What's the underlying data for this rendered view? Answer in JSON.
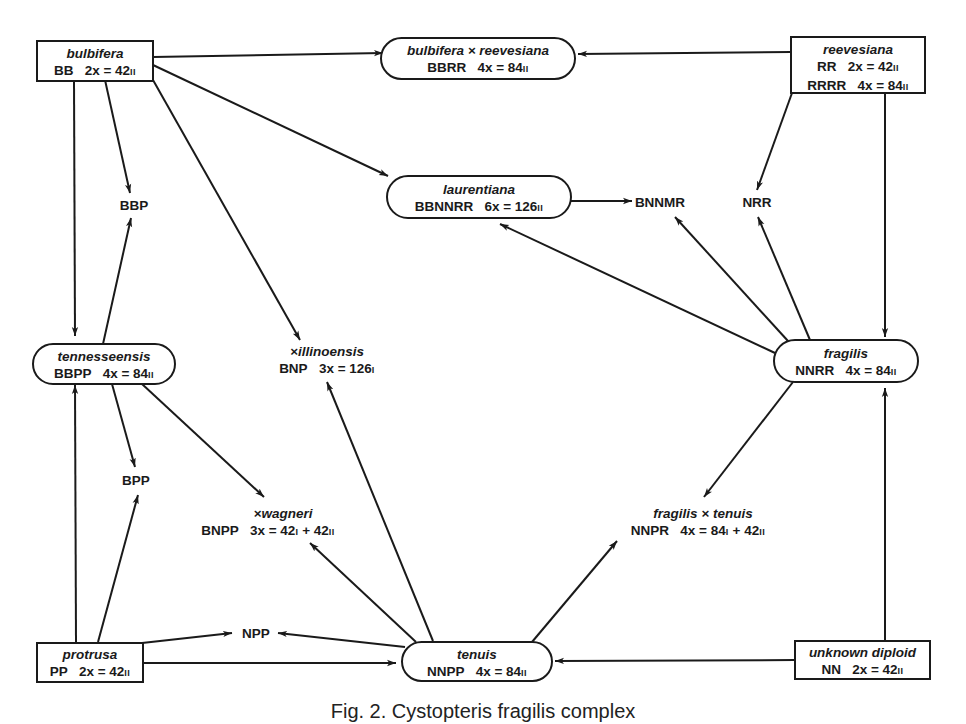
{
  "nodes": {
    "bulbifera": {
      "name": "bulbifera",
      "genome": "BB",
      "formula": "2x = 42",
      "pairing": "II"
    },
    "bulb_x_reev": {
      "name": "bulbifera × reevesiana",
      "genome": "BBRR",
      "formula": "4x = 84",
      "pairing": "II"
    },
    "reevesiana": {
      "name": "reevesiana",
      "genome": "RR",
      "formula": "2x = 42",
      "pairing": "II",
      "genome2": "RRRR",
      "formula2": "4x = 84",
      "pairing2": "II"
    },
    "bbp": {
      "genome": "BBP"
    },
    "laurentiana": {
      "name": "laurentiana",
      "genome": "BBNNRR",
      "formula": "6x = 126",
      "pairing": "II"
    },
    "bnnmr": {
      "genome": "BNNMR"
    },
    "nrr": {
      "genome": "NRR"
    },
    "tennesseensis": {
      "name": "tennesseensis",
      "genome": "BBPP",
      "formula": "4x = 84",
      "pairing": "II"
    },
    "illinoensis": {
      "name": "×illinoensis",
      "genome": "BNP",
      "formula": "3x = 126",
      "pairing": "I"
    },
    "fragilis": {
      "name": "fragilis",
      "genome": "NNRR",
      "formula": "4x = 84",
      "pairing": "II"
    },
    "bpp": {
      "genome": "BPP"
    },
    "wagneri": {
      "name": "×wagneri",
      "genome": "BNPP",
      "formula": "3x = 42",
      "pairing": "I",
      "formula_b": "+ 42",
      "pairing_b": "II"
    },
    "frag_x_ten": {
      "name": "fragilis × tenuis",
      "genome": "NNPR",
      "formula": "4x = 84",
      "pairing": "I",
      "formula_b": "+ 42",
      "pairing_b": "II"
    },
    "npp": {
      "genome": "NPP"
    },
    "protrusa": {
      "name": "protrusa",
      "genome": "PP",
      "formula": "2x = 42",
      "pairing": "II"
    },
    "tenuis": {
      "name": "tenuis",
      "genome": "NNPP",
      "formula": "4x = 84",
      "pairing": "II"
    },
    "unknown": {
      "name": "unknown diploid",
      "genome": "NN",
      "formula": "2x = 42",
      "pairing": "II"
    }
  },
  "edges": [
    {
      "from": "bulbifera",
      "to": "bulb_x_reev"
    },
    {
      "from": "reevesiana",
      "to": "bulb_x_reev"
    },
    {
      "from": "bulbifera",
      "to": "bbp"
    },
    {
      "from": "tennesseensis",
      "to": "bbp"
    },
    {
      "from": "bulbifera",
      "to": "laurentiana"
    },
    {
      "from": "laurentiana",
      "to": "bnnmr"
    },
    {
      "from": "reevesiana",
      "to": "nrr"
    },
    {
      "from": "fragilis",
      "to": "nrr"
    },
    {
      "from": "fragilis",
      "to": "bnnmr"
    },
    {
      "from": "fragilis",
      "to": "laurentiana"
    },
    {
      "from": "reevesiana",
      "to": "fragilis"
    },
    {
      "from": "bulbifera",
      "to": "tennesseensis"
    },
    {
      "from": "bulbifera",
      "to": "illinoensis"
    },
    {
      "from": "tenuis",
      "to": "illinoensis"
    },
    {
      "from": "tennesseensis",
      "to": "bpp"
    },
    {
      "from": "protrusa",
      "to": "bpp"
    },
    {
      "from": "tennesseensis",
      "to": "wagneri"
    },
    {
      "from": "tenuis",
      "to": "wagneri"
    },
    {
      "from": "fragilis",
      "to": "frag_x_ten"
    },
    {
      "from": "tenuis",
      "to": "frag_x_ten"
    },
    {
      "from": "protrusa",
      "to": "tennesseensis"
    },
    {
      "from": "protrusa",
      "to": "npp"
    },
    {
      "from": "tenuis",
      "to": "npp"
    },
    {
      "from": "protrusa",
      "to": "tenuis"
    },
    {
      "from": "unknown",
      "to": "tenuis"
    },
    {
      "from": "unknown",
      "to": "fragilis"
    }
  ],
  "caption": "Fig. 2. Cystopteris fragilis complex"
}
